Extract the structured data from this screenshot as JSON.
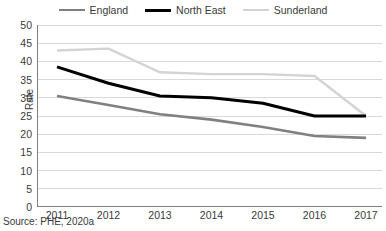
{
  "source_note": "Source: PHE, 2020a",
  "axis": {
    "ylabel": "Rate",
    "yticks": [
      "50",
      "45",
      "40",
      "35",
      "30",
      "25",
      "20",
      "15",
      "10",
      "5",
      "0"
    ],
    "xticks": [
      "2011",
      "2012",
      "2013",
      "2014",
      "2015",
      "2016",
      "2017"
    ]
  },
  "legend": {
    "items": [
      {
        "label": "England",
        "color": "#808080",
        "width": 2.6
      },
      {
        "label": "North East",
        "color": "#000000",
        "width": 3.0
      },
      {
        "label": "Sunderland",
        "color": "#d4d4d4",
        "width": 2.4
      }
    ]
  },
  "colors": {
    "england": "#808080",
    "north_east": "#000000",
    "sunderland": "#d4d4d4",
    "grid": "#d9d9d9",
    "axis": "#7f7f7f",
    "text": "#3a3a3a",
    "background": "#ffffff"
  },
  "chart_data": {
    "type": "line",
    "title": "",
    "subtitle": "",
    "xlabel": "",
    "ylabel": "Rate",
    "x": [
      2011,
      2012,
      2013,
      2014,
      2015,
      2016,
      2017
    ],
    "categories": [
      "2011",
      "2012",
      "2013",
      "2014",
      "2015",
      "2016",
      "2017"
    ],
    "xlim": [
      2010.6,
      2017.4
    ],
    "ylim": [
      0,
      50
    ],
    "ytick_step": 5,
    "grid": "horizontal",
    "legend_position": "top-center",
    "annotations": [
      "Source: PHE, 2020a"
    ],
    "series": [
      {
        "name": "England",
        "color": "#808080",
        "values": [
          30.5,
          28.0,
          25.5,
          24.0,
          22.0,
          19.5,
          19.0
        ]
      },
      {
        "name": "North East",
        "color": "#000000",
        "values": [
          38.5,
          34.0,
          30.5,
          30.0,
          28.5,
          25.0,
          25.0
        ]
      },
      {
        "name": "Sunderland",
        "color": "#d4d4d4",
        "values": [
          43.0,
          43.5,
          37.0,
          36.5,
          36.5,
          36.0,
          25.0
        ]
      }
    ]
  }
}
